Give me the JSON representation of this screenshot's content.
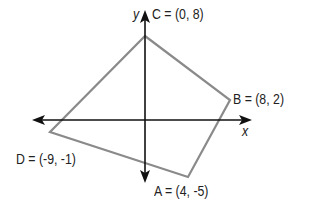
{
  "diagram": {
    "axes": {
      "x_label": "x",
      "y_label": "y"
    },
    "points": [
      {
        "name": "C",
        "label": "C = (0, 8)",
        "coords": [
          0,
          8
        ]
      },
      {
        "name": "B",
        "label": "B = (8, 2)",
        "coords": [
          8,
          2
        ]
      },
      {
        "name": "A",
        "label": "A = (4, -5)",
        "coords": [
          4,
          -5
        ]
      },
      {
        "name": "D",
        "label": "D = (-9, -1)",
        "coords": [
          -9,
          -1
        ]
      }
    ],
    "colors": {
      "polygon": "#8a8a8a",
      "axes": "#111111",
      "text": "#222222"
    }
  }
}
